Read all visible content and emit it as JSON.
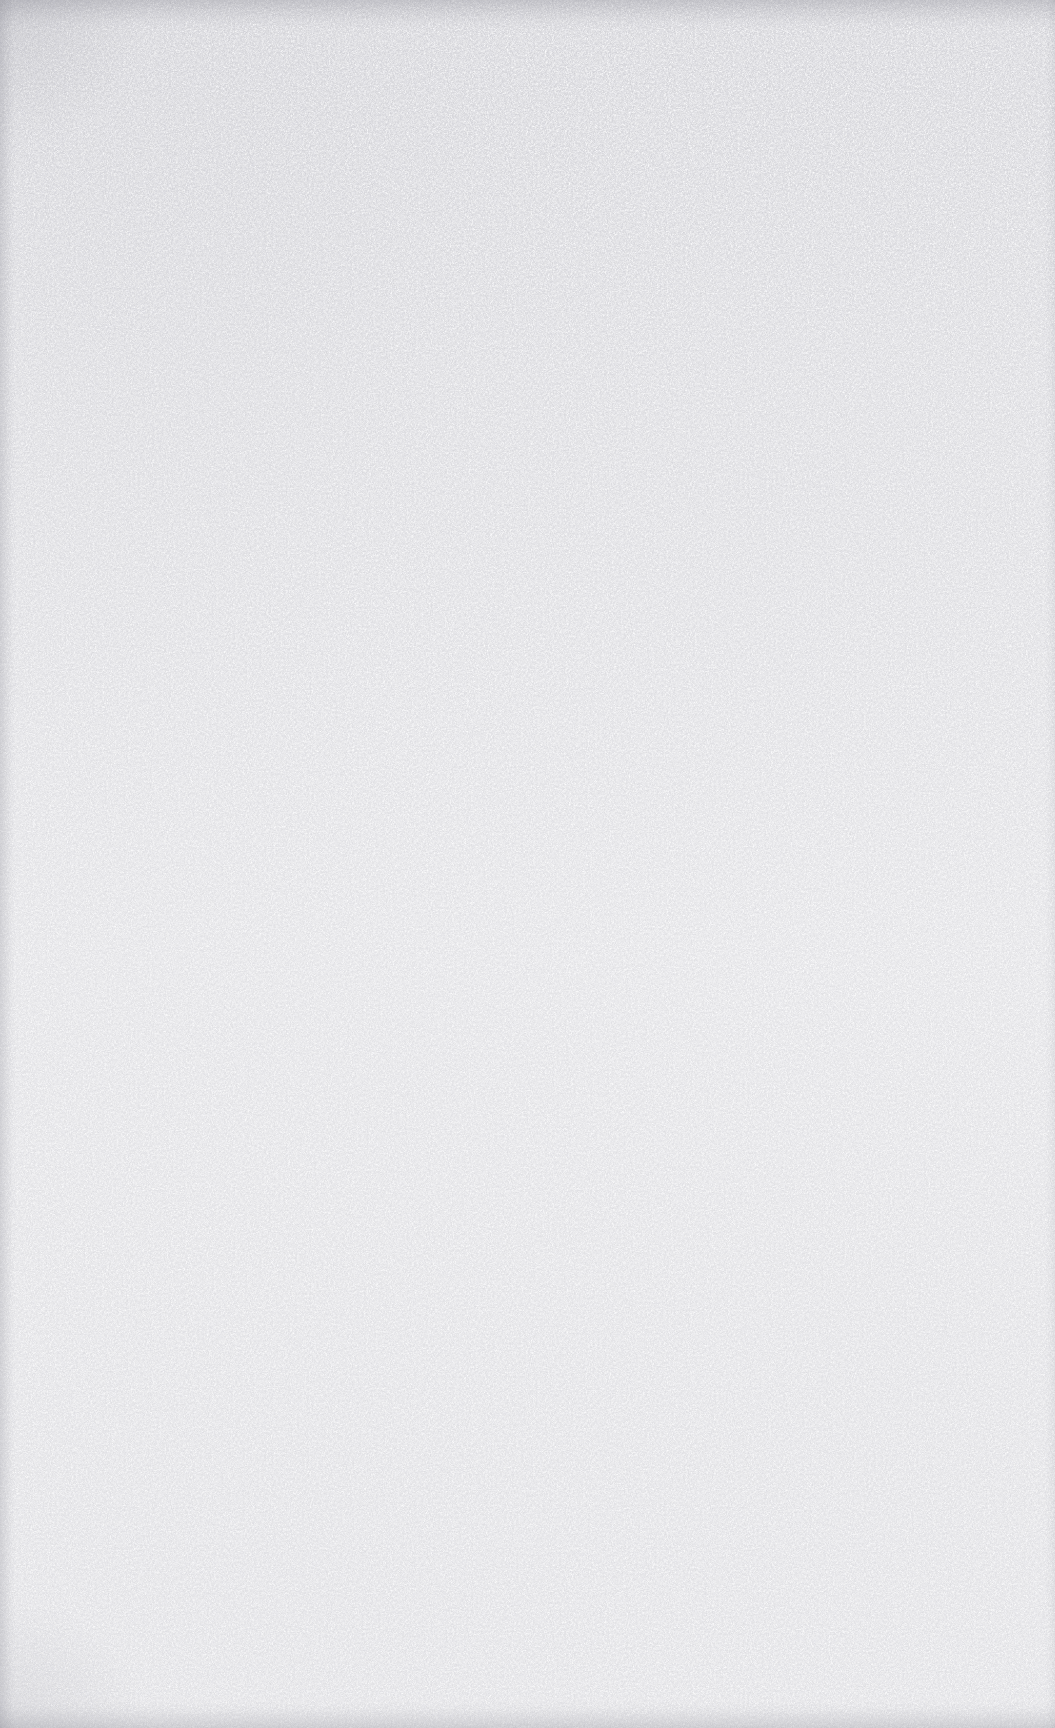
{
  "page": {
    "kind": "blank-scanned-page",
    "width": 1055,
    "height": 1728,
    "visible_text": "",
    "paper_color": "#fcfcfd",
    "speckle_color": "#c9c9ce",
    "edge_shadow_color": "#80808a",
    "edges": {
      "top_band_height": 30,
      "bottom_band_height": 26,
      "left_band_width": 16,
      "right_band_width": 10
    }
  }
}
